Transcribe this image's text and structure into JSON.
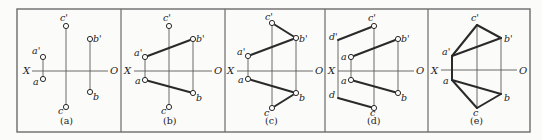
{
  "figure": {
    "frame": {
      "x1": 17,
      "y1": 9,
      "x2": 530,
      "y2": 132,
      "color": "#6b6b6b"
    },
    "dividers": [
      121,
      225,
      325,
      428
    ],
    "line_color": "#2a2a2a",
    "thin_color": "#5a5a5a",
    "panels": [
      {
        "id": "a",
        "caption": "(a)",
        "caption_pos": [
          60,
          124
        ],
        "axis": {
          "x1": 32,
          "x2": 108,
          "y": 71,
          "x_label": "X",
          "o_label": "O",
          "x_label_pos": [
            23,
            74
          ],
          "o_label_pos": [
            110,
            74
          ]
        },
        "points": [
          {
            "name": "a'",
            "x": 43,
            "y": 57,
            "lx": 32,
            "ly": 54
          },
          {
            "name": "a",
            "x": 43,
            "y": 79,
            "lx": 33,
            "ly": 85
          },
          {
            "name": "b'",
            "x": 90,
            "y": 39,
            "lx": 93,
            "ly": 42
          },
          {
            "name": "b",
            "x": 90,
            "y": 92,
            "lx": 93,
            "ly": 100
          },
          {
            "name": "c'",
            "x": 66,
            "y": 26,
            "lx": 60,
            "ly": 21
          },
          {
            "name": "c",
            "x": 66,
            "y": 107,
            "lx": 58,
            "ly": 114
          }
        ],
        "thin_lines": [
          [
            43,
            57,
            43,
            79
          ],
          [
            90,
            39,
            90,
            92
          ],
          [
            66,
            26,
            66,
            107
          ]
        ],
        "thick_lines": []
      },
      {
        "id": "b",
        "caption": "(b)",
        "caption_pos": [
          163,
          124
        ],
        "axis": {
          "x1": 134,
          "x2": 212,
          "y": 71,
          "x_label": "X",
          "o_label": "O",
          "x_label_pos": [
            124,
            74
          ],
          "o_label_pos": [
            214,
            74
          ]
        },
        "points": [
          {
            "name": "a'",
            "x": 145,
            "y": 57,
            "lx": 134,
            "ly": 56
          },
          {
            "name": "a",
            "x": 145,
            "y": 80,
            "lx": 135,
            "ly": 84
          },
          {
            "name": "b'",
            "x": 193,
            "y": 39,
            "lx": 196,
            "ly": 42
          },
          {
            "name": "b",
            "x": 193,
            "y": 93,
            "lx": 196,
            "ly": 101
          },
          {
            "name": "c'",
            "x": 169,
            "y": 26,
            "lx": 163,
            "ly": 21
          },
          {
            "name": "c",
            "x": 169,
            "y": 107,
            "lx": 161,
            "ly": 114
          }
        ],
        "thin_lines": [
          [
            145,
            57,
            145,
            80
          ],
          [
            193,
            39,
            193,
            93
          ],
          [
            169,
            26,
            169,
            107
          ]
        ],
        "thick_lines": [
          [
            145,
            57,
            193,
            39
          ],
          [
            145,
            80,
            193,
            93
          ]
        ]
      },
      {
        "id": "c",
        "caption": "(c)",
        "caption_pos": [
          265,
          124
        ],
        "axis": {
          "x1": 237,
          "x2": 313,
          "y": 71,
          "x_label": "X",
          "o_label": "O",
          "x_label_pos": [
            227,
            74
          ],
          "o_label_pos": [
            315,
            74
          ]
        },
        "points": [
          {
            "name": "a'",
            "x": 248,
            "y": 56,
            "lx": 237,
            "ly": 55
          },
          {
            "name": "a",
            "x": 248,
            "y": 79,
            "lx": 238,
            "ly": 83
          },
          {
            "name": "b'",
            "x": 296,
            "y": 38,
            "lx": 299,
            "ly": 42
          },
          {
            "name": "b",
            "x": 296,
            "y": 93,
            "lx": 299,
            "ly": 101
          },
          {
            "name": "c'",
            "x": 272,
            "y": 23,
            "lx": 265,
            "ly": 20
          },
          {
            "name": "c",
            "x": 272,
            "y": 108,
            "lx": 264,
            "ly": 116
          }
        ],
        "thin_lines": [
          [
            248,
            56,
            248,
            79
          ],
          [
            296,
            38,
            296,
            93
          ],
          [
            272,
            23,
            272,
            108
          ]
        ],
        "thick_lines": [
          [
            248,
            56,
            296,
            38
          ],
          [
            248,
            79,
            296,
            93
          ],
          [
            272,
            23,
            296,
            38
          ],
          [
            272,
            108,
            296,
            93
          ]
        ]
      },
      {
        "id": "d",
        "caption": "(d)",
        "caption_pos": [
          367,
          124
        ],
        "axis": {
          "x1": 338,
          "x2": 414,
          "y": 71,
          "x_label": "X",
          "o_label": "O",
          "x_label_pos": [
            328,
            74
          ],
          "o_label_pos": [
            416,
            74
          ]
        },
        "points": [
          {
            "name": "d'",
            "x": 338,
            "y": 40,
            "lx": 329,
            "ly": 40,
            "no_circle": true
          },
          {
            "name": "a",
            "x": 351,
            "y": 57,
            "lx": 341,
            "ly": 60
          },
          {
            "name": "a",
            "x": 351,
            "y": 80,
            "lx": 341,
            "ly": 84
          },
          {
            "name": "b'",
            "x": 398,
            "y": 39,
            "lx": 401,
            "ly": 42
          },
          {
            "name": "b",
            "x": 398,
            "y": 93,
            "lx": 401,
            "ly": 101
          },
          {
            "name": "c'",
            "x": 374,
            "y": 26,
            "lx": 368,
            "ly": 21
          },
          {
            "name": "c",
            "x": 374,
            "y": 108,
            "lx": 370,
            "ly": 116
          },
          {
            "name": "d",
            "x": 338,
            "y": 98,
            "lx": 329,
            "ly": 98,
            "no_circle": true
          }
        ],
        "thin_lines": [
          [
            351,
            57,
            351,
            80
          ],
          [
            398,
            39,
            398,
            93
          ],
          [
            374,
            26,
            374,
            108
          ],
          [
            338,
            40,
            338,
            98
          ]
        ],
        "thick_lines": [
          [
            351,
            57,
            398,
            39
          ],
          [
            351,
            80,
            398,
            93
          ],
          [
            338,
            40,
            374,
            26
          ],
          [
            338,
            98,
            374,
            108
          ]
        ]
      },
      {
        "id": "e",
        "caption": "(e)",
        "caption_pos": [
          470,
          124
        ],
        "axis": {
          "x1": 441,
          "x2": 517,
          "y": 70,
          "x_label": "X",
          "o_label": "O",
          "x_label_pos": [
            431,
            74
          ],
          "o_label_pos": [
            519,
            74
          ]
        },
        "points": [
          {
            "name": "a'",
            "x": 452,
            "y": 56,
            "lx": 442,
            "ly": 55,
            "no_circle": true
          },
          {
            "name": "a",
            "x": 452,
            "y": 80,
            "lx": 443,
            "ly": 84,
            "no_circle": true
          },
          {
            "name": "b'",
            "x": 501,
            "y": 38,
            "lx": 504,
            "ly": 42,
            "no_circle": true
          },
          {
            "name": "b",
            "x": 501,
            "y": 94,
            "lx": 504,
            "ly": 101,
            "no_circle": true
          },
          {
            "name": "c'",
            "x": 477,
            "y": 25,
            "lx": 471,
            "ly": 21,
            "no_circle": true
          },
          {
            "name": "c",
            "x": 477,
            "y": 108,
            "lx": 473,
            "ly": 116,
            "no_circle": true
          }
        ],
        "thin_lines": [
          [
            501,
            38,
            501,
            94
          ],
          [
            477,
            25,
            477,
            108
          ]
        ],
        "thick_lines": [
          [
            452,
            56,
            452,
            80
          ],
          [
            452,
            56,
            501,
            38
          ],
          [
            452,
            56,
            477,
            25
          ],
          [
            477,
            25,
            501,
            38
          ],
          [
            452,
            80,
            501,
            94
          ],
          [
            452,
            80,
            477,
            108
          ],
          [
            477,
            108,
            501,
            94
          ]
        ]
      }
    ]
  }
}
